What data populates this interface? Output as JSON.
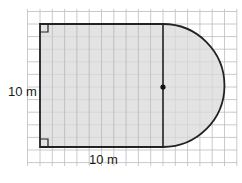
{
  "diagram": {
    "type": "composite-shape-area",
    "labels": {
      "height": "10 m",
      "width": "10 m"
    },
    "shape": {
      "rectangle": {
        "width_m": 10,
        "height_m": 10,
        "right_angle_marks": 2
      },
      "semicircle": {
        "diameter_m": 10,
        "center_marked": true,
        "side": "right"
      }
    },
    "colors": {
      "fill": "#d9d9d9",
      "outline": "#222222",
      "grid": "#bdbdbd"
    }
  }
}
